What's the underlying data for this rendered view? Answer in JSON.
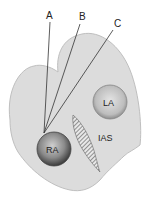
{
  "labels": {
    "a": "A",
    "b": "B",
    "c": "C",
    "la": "LA",
    "ra": "RA",
    "ias": "IAS"
  },
  "colors": {
    "body_fill": "#dcdcdc",
    "body_stroke": "#b0b0b0",
    "chamber_dark": "#4a4a4a",
    "chamber_light": "#d8d8d8",
    "line": "#333333"
  }
}
